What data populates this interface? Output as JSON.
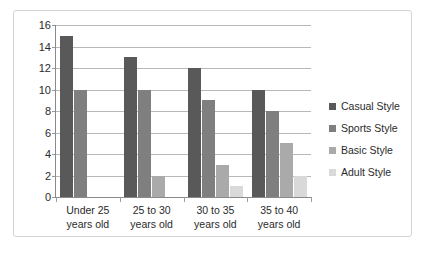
{
  "chart_data": {
    "type": "bar",
    "title": "",
    "subtitle": "",
    "xlabel": "",
    "ylabel": "",
    "ylim": [
      0,
      16
    ],
    "ytick_step": 2,
    "yticks": [
      16,
      14,
      12,
      10,
      8,
      6,
      4,
      2,
      0
    ],
    "grid": true,
    "legend_position": "right",
    "orientation": "vertical",
    "grouping": "clustered",
    "categories": [
      "Under 25 years old",
      "25 to 30 years old",
      "30 to 35 years old",
      "35 to 40 years old"
    ],
    "category_lines": [
      [
        "Under 25",
        "years old"
      ],
      [
        "25 to 30",
        "years old"
      ],
      [
        "30 to 35",
        "years old"
      ],
      [
        "35 to 40",
        "years old"
      ]
    ],
    "series": [
      {
        "name": "Casual Style",
        "color": "#595959",
        "values": [
          15,
          13,
          12,
          10
        ]
      },
      {
        "name": "Sports Style",
        "color": "#7f7f7f",
        "values": [
          10,
          10,
          9,
          8
        ]
      },
      {
        "name": "Basic Style",
        "color": "#aaaaaa",
        "values": [
          0,
          2,
          3,
          5
        ]
      },
      {
        "name": "Adult Style",
        "color": "#d9d9d9",
        "values": [
          0,
          0,
          1,
          2
        ]
      }
    ]
  },
  "frame": {
    "border_color": "#d4d4d4",
    "background": "#ffffff"
  },
  "axis": {
    "line_color": "#8a8a8a",
    "gridline_color": "#b8b8b8",
    "tick_color": "#9a9a9a",
    "label_color": "#2b2b2b"
  }
}
